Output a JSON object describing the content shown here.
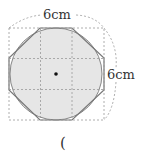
{
  "diagram": {
    "top_label": "6cm",
    "right_label": "6cm",
    "answer_paren": "(",
    "colors": {
      "fill": "#e6e6e6",
      "outline": "#888888",
      "dashed": "#999999",
      "center_dot": "#111111"
    }
  }
}
